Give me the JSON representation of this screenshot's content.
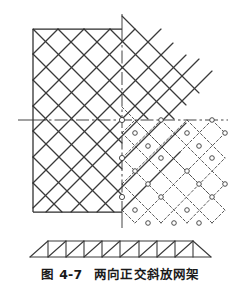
{
  "figure": {
    "caption_label": "图 4-7",
    "caption_title": "两向正交斜放网架",
    "caption_full": "图 4-7  两向正交斜放网架"
  },
  "colors": {
    "line": "#3a3a3a",
    "border": "#2b2b2b",
    "dashed": "#4a4a4a",
    "node_fill": "#ffffff",
    "background": "#ffffff",
    "caption": "#1a1a1a"
  },
  "diagram": {
    "type": "engineering-plan-and-elevation",
    "plan": {
      "boundary": {
        "x": 33,
        "y": 29,
        "width": 89,
        "height": 183
      },
      "centerlines": {
        "horizontal": {
          "y": 120,
          "x_start": 18,
          "x_end": 228,
          "style": "dash-dot"
        },
        "vertical": {
          "x": 122,
          "y_start": 14,
          "y_end": 228,
          "style": "dash-dot"
        }
      },
      "grid": {
        "orientation": "45-degree-diagonal",
        "module": 25.5,
        "top_chord_style": "solid",
        "bottom_chord_style": "dashed",
        "node_marker": "open-circle",
        "node_radius": 2.2
      }
    },
    "elevation": {
      "type": "tapered-truss",
      "x_start": 30,
      "x_end": 211,
      "top_y": 241,
      "bottom_y": 257,
      "panels": 9
    }
  }
}
